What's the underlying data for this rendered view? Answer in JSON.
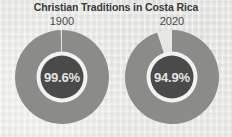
{
  "chart_data": {
    "type": "pie",
    "title": "Christian Traditions in Costa Rica",
    "xlabel": "",
    "ylabel": "",
    "legend_position": "none",
    "grid": false,
    "charts": [
      {
        "name": "1900",
        "year_label": "1900",
        "center_label": "94.9%",
        "slices": [
          {
            "name": "Christian",
            "value": 99.6,
            "color": "#8b8b89",
            "label": "99.6%"
          },
          {
            "name": "Other",
            "value": 0.4,
            "color": "#e6e6e4",
            "label": "0.4%"
          }
        ]
      },
      {
        "name": "2020",
        "year_label": "2020",
        "center_label": "94.9%",
        "slices": [
          {
            "name": "Christian",
            "value": 94.9,
            "color": "#8b8b89",
            "label": "94.9%"
          },
          {
            "name": "Other",
            "value": 5.1,
            "color": "#e6e6e4",
            "label": "5.1%"
          }
        ]
      }
    ],
    "colors": {
      "background": "#e9e9e7",
      "ring_primary": "#8b8b89",
      "ring_secondary": "#e6e6e4",
      "inner_disc": "#4a4a4a",
      "inner_gap": "#f2f2f0",
      "title_text": "#3a3a3a",
      "year_text": "#4a4a4a",
      "center_text": "#e4e4e2"
    }
  },
  "left": {
    "year": "1900",
    "percent": "99.6%"
  },
  "right": {
    "year": "2020",
    "percent": "94.9%"
  },
  "header": {
    "title": "Christian Traditions in Costa Rica"
  }
}
